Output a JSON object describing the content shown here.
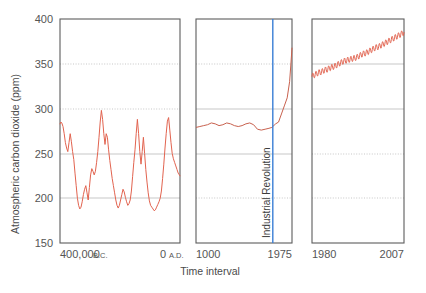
{
  "chart_data": {
    "type": "line",
    "title": "",
    "xlabel": "Time interval",
    "ylabel": "Atmospheric carbon dioxide (ppm)",
    "ylim": [
      150,
      400
    ],
    "yticks": [
      150,
      200,
      250,
      300,
      350,
      400
    ],
    "ytick_labels": [
      "150",
      "200",
      "250",
      "300",
      "350",
      "400"
    ],
    "grid": true,
    "legend_position": "none",
    "series_color": "#e2634f",
    "annotation_color": "#3a7fd5",
    "panels": [
      {
        "name": "ice-core-panel",
        "xlabel_left": "400,000",
        "xlabel_left_suffix": "B.C.",
        "xlabel_right": "0",
        "xlabel_right_suffix": "A.D.",
        "xlim": [
          -400000,
          0
        ],
        "xticks": [
          -400000,
          0
        ],
        "description": "Ice core record, glacial-interglacial cycles",
        "x": [
          -400000,
          -397000,
          -394000,
          -390000,
          -386000,
          -382000,
          -378000,
          -374000,
          -370000,
          -366000,
          -362000,
          -358000,
          -354000,
          -350000,
          -346000,
          -342000,
          -338000,
          -334000,
          -330000,
          -326000,
          -322000,
          -318000,
          -314000,
          -310000,
          -306000,
          -302000,
          -298000,
          -294000,
          -290000,
          -286000,
          -282000,
          -278000,
          -274000,
          -270000,
          -266000,
          -262000,
          -258000,
          -254000,
          -250000,
          -246000,
          -242000,
          -238000,
          -234000,
          -230000,
          -226000,
          -222000,
          -218000,
          -214000,
          -210000,
          -206000,
          -202000,
          -198000,
          -194000,
          -190000,
          -186000,
          -182000,
          -178000,
          -174000,
          -170000,
          -166000,
          -162000,
          -158000,
          -154000,
          -150000,
          -146000,
          -142000,
          -138000,
          -134000,
          -130000,
          -126000,
          -122000,
          -118000,
          -114000,
          -110000,
          -106000,
          -102000,
          -98000,
          -94000,
          -90000,
          -86000,
          -82000,
          -78000,
          -74000,
          -70000,
          -66000,
          -62000,
          -58000,
          -54000,
          -50000,
          -46000,
          -42000,
          -38000,
          -34000,
          -30000,
          -26000,
          -22000,
          -18000,
          -14000,
          -10000,
          -6000,
          -2000,
          0
        ],
        "y": [
          283,
          285,
          284,
          280,
          272,
          262,
          256,
          252,
          262,
          272,
          263,
          252,
          243,
          228,
          214,
          200,
          192,
          188,
          190,
          196,
          204,
          210,
          214,
          206,
          198,
          212,
          226,
          233,
          230,
          226,
          230,
          240,
          252,
          268,
          285,
          298,
          288,
          272,
          260,
          272,
          268,
          254,
          242,
          232,
          222,
          214,
          206,
          198,
          192,
          189,
          192,
          198,
          204,
          210,
          207,
          201,
          196,
          192,
          194,
          198,
          208,
          224,
          240,
          254,
          272,
          288,
          272,
          252,
          238,
          252,
          268,
          250,
          232,
          218,
          206,
          197,
          192,
          190,
          188,
          186,
          187,
          190,
          193,
          196,
          200,
          208,
          222,
          238,
          256,
          272,
          286,
          290,
          276,
          262,
          250,
          244,
          240,
          236,
          232,
          228,
          226,
          225
        ]
      },
      {
        "name": "historical-panel",
        "xlabel_left": "1000",
        "xlabel_right": "1975",
        "xlim": [
          1000,
          2000
        ],
        "xticks": [
          1000,
          1975
        ],
        "description": "Last millennium, Industrial Revolution onset",
        "annotation": "Industrial Revolution",
        "annotation_x": 1800,
        "x": [
          1000,
          1040,
          1080,
          1120,
          1160,
          1200,
          1240,
          1280,
          1320,
          1360,
          1400,
          1440,
          1480,
          1520,
          1560,
          1600,
          1640,
          1680,
          1720,
          1760,
          1790,
          1800,
          1830,
          1860,
          1890,
          1920,
          1950,
          1975,
          1990,
          2000
        ],
        "y": [
          279,
          280,
          281,
          282,
          284,
          283,
          281,
          282,
          284,
          283,
          281,
          280,
          281,
          283,
          284,
          282,
          277,
          276,
          277,
          278,
          279,
          280,
          283,
          285,
          294,
          303,
          312,
          330,
          352,
          368
        ]
      },
      {
        "name": "keeling-panel",
        "xlabel_left": "1980",
        "xlabel_right": "2007",
        "xlim": [
          1979,
          2008
        ],
        "xticks": [
          1980,
          2007
        ],
        "description": "Mauna Loa record with seasonal oscillation",
        "x": [
          1979,
          1980,
          1981,
          1982,
          1983,
          1984,
          1985,
          1986,
          1987,
          1988,
          1989,
          1990,
          1991,
          1992,
          1993,
          1994,
          1995,
          1996,
          1997,
          1998,
          1999,
          2000,
          2001,
          2002,
          2003,
          2004,
          2005,
          2006,
          2007,
          2008
        ],
        "y": [
          336,
          338,
          340,
          341,
          343,
          344,
          346,
          347,
          349,
          351,
          353,
          354,
          355,
          356,
          357,
          359,
          361,
          362,
          364,
          366,
          368,
          369,
          371,
          373,
          375,
          377,
          379,
          381,
          383,
          385
        ],
        "seasonal_amplitude": 3.2
      }
    ]
  }
}
